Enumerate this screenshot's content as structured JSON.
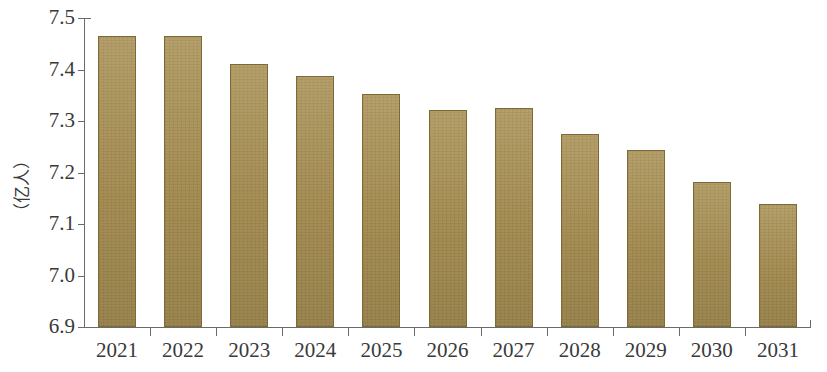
{
  "chart_data": {
    "type": "bar",
    "title": "",
    "subtitle": "",
    "xlabel": "",
    "ylabel": "（亿人）",
    "categories": [
      "2021",
      "2022",
      "2023",
      "2024",
      "2025",
      "2026",
      "2027",
      "2028",
      "2029",
      "2030",
      "2031"
    ],
    "values": [
      7.465,
      7.466,
      7.41,
      7.387,
      7.353,
      7.322,
      7.325,
      7.275,
      7.244,
      7.181,
      7.139
    ],
    "ylim": [
      6.9,
      7.5
    ],
    "ytick_labels": [
      "7.5",
      "7.4",
      "7.3",
      "7.2",
      "7.1",
      "7.0",
      "6.9"
    ],
    "ytick_values": [
      7.5,
      7.4,
      7.3,
      7.2,
      7.1,
      7.0,
      6.9
    ],
    "grid": false,
    "legend": null,
    "legend_position": "none",
    "bar_color": "#a88f52",
    "bar_edge_color": "#7e6a37",
    "axis_color": "#6a6a6a",
    "background_color": "#ffffff"
  },
  "axis": {
    "y_title": "（亿人）"
  }
}
